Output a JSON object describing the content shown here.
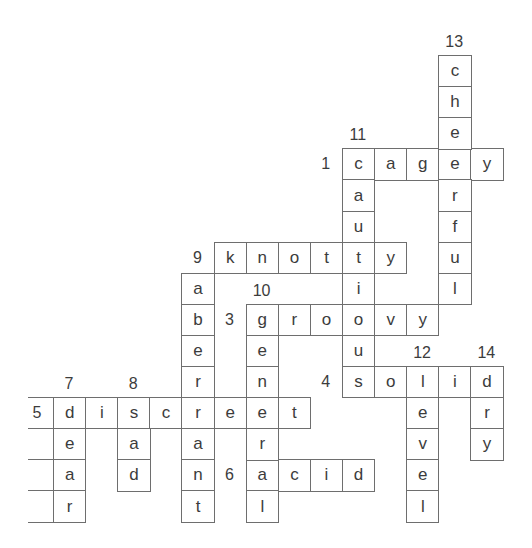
{
  "puzzle": {
    "type": "crossword",
    "grid_origin": {
      "x": 53,
      "y": 55
    },
    "cell_width": 32.1,
    "cell_height": 31.1,
    "colors": {
      "line": "#6e6e6e",
      "text": "#3c3c3c",
      "background": "#ffffff"
    }
  },
  "entries": [
    {
      "number": "1",
      "direction": "across",
      "answer": "cagey",
      "row": 3,
      "col": 9
    },
    {
      "number": "3",
      "direction": "across",
      "answer": "groovy",
      "row": 8,
      "col": 6
    },
    {
      "number": "4",
      "direction": "across",
      "answer": "solid",
      "row": 10,
      "col": 9
    },
    {
      "number": "5",
      "direction": "across",
      "answer": "discreet",
      "row": 11,
      "col": 0
    },
    {
      "number": "6",
      "direction": "across",
      "answer": "acid",
      "row": 13,
      "col": 6
    },
    {
      "number": "9",
      "direction": "across",
      "answer": "knotty",
      "row": 6,
      "col": 5
    },
    {
      "number": "7",
      "direction": "down",
      "answer": "dear",
      "row": 11,
      "col": 0
    },
    {
      "number": "8",
      "direction": "down",
      "answer": "sad",
      "row": 11,
      "col": 2
    },
    {
      "number": "9",
      "direction": "down",
      "answer": "aberrant",
      "row": 7,
      "col": 4
    },
    {
      "number": "10",
      "direction": "down",
      "answer": "general",
      "row": 8,
      "col": 6
    },
    {
      "number": "11",
      "direction": "down",
      "answer": "cautious",
      "row": 3,
      "col": 9
    },
    {
      "number": "12",
      "direction": "down",
      "answer": "level",
      "row": 10,
      "col": 11
    },
    {
      "number": "13",
      "direction": "down",
      "answer": "cheerful",
      "row": 0,
      "col": 12
    },
    {
      "number": "14",
      "direction": "down",
      "answer": "dry",
      "row": 10,
      "col": 13
    }
  ],
  "left_stub_rows": [
    12,
    13,
    14
  ]
}
